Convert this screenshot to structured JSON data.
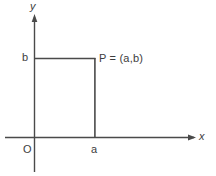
{
  "figure": {
    "background_color": "#ffffff",
    "stroke_color": "#4a4a4a",
    "text_color": "#3d3d3d",
    "width": 216,
    "height": 176
  },
  "axes": {
    "x_axis": {
      "label": "x",
      "y_position": 137,
      "x_start": 5,
      "x_end": 196,
      "arrow": "right"
    },
    "y_axis": {
      "label": "y",
      "x_position": 34,
      "y_start": 172,
      "y_end": 15,
      "arrow": "up"
    },
    "origin": {
      "label": "O",
      "x": 34,
      "y": 137
    }
  },
  "ticks": {
    "x_tick": {
      "label": "a",
      "x": 95
    },
    "y_tick": {
      "label": "b",
      "y": 58
    }
  },
  "point": {
    "label": "P = (a,b)",
    "x": 95,
    "y": 58,
    "coordinates": {
      "x_value": "a",
      "y_value": "b"
    }
  },
  "guide_lines": {
    "horizontal": {
      "from_x": 34,
      "to_x": 95,
      "y": 58
    },
    "vertical": {
      "x": 95,
      "from_y": 58,
      "to_y": 137
    }
  }
}
